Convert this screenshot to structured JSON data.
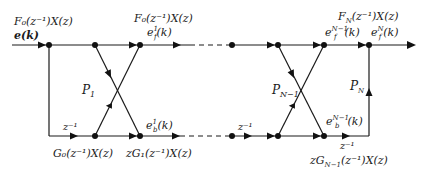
{
  "diagram": {
    "colors": {
      "stroke": "#1a1a1a",
      "background": "#ffffff"
    },
    "labels": {
      "input_top": "F₀(z⁻¹)X(z)",
      "input_signal": "e(k)",
      "stage1_top": "F₀(z⁻¹)X(z)",
      "stage1_forward": "e",
      "stage1_forward_sup": "1",
      "stage1_forward_sub": "f",
      "stage1_forward_arg": "(k)",
      "stage1_backward": "e",
      "stage1_backward_sup": "1",
      "stage1_backward_sub": "b",
      "stage1_backward_arg": "(k)",
      "p1": "P",
      "p1_sub": "1",
      "z_inv_left": "z⁻¹",
      "g0": "G₀(z⁻¹)X(z)",
      "g1": "zG₁(z⁻¹)X(z)",
      "pn1": "P",
      "pn1_sub": "N−1",
      "z_inv_mid": "z⁻¹",
      "fn_top": "F",
      "fn_top_sub": "N",
      "fn_top_rest": "(z⁻¹)X(z)",
      "forward_n1": "e",
      "forward_n1_sup": "N−1",
      "forward_n1_sub": "f",
      "forward_n1_arg": "(k)",
      "forward_n": "e",
      "forward_n_sup": "N",
      "forward_n_sub": "f",
      "forward_n_arg": "(k)",
      "backward_n1": "e",
      "backward_n1_sup": "N−1",
      "backward_n1_sub": "b",
      "backward_n1_arg": "(k)",
      "pn": "P",
      "pn_sub": "N",
      "z_inv_right": "z⁻¹",
      "gn1": "zG",
      "gn1_sub": "N−1",
      "gn1_rest": "(z⁻¹)X(z)"
    }
  }
}
